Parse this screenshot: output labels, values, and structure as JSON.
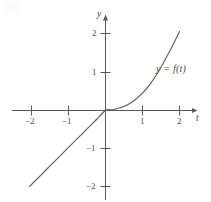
{
  "figure": {
    "name": "graph-of-y-equals-f-of-t",
    "background_color": "#ffffff",
    "ink_color": "#5a5a5a",
    "text_color": "#4a4a4a"
  },
  "axes": {
    "x_axis_name": "t",
    "y_axis_name": "y",
    "x_ticks": [
      {
        "value": -2,
        "label": "−2"
      },
      {
        "value": -1,
        "label": "−1"
      },
      {
        "value": 1,
        "label": "1"
      },
      {
        "value": 2,
        "label": "2"
      }
    ],
    "y_ticks": [
      {
        "value": 2,
        "label": "2"
      },
      {
        "value": 1,
        "label": "1"
      },
      {
        "value": -1,
        "label": "−1"
      },
      {
        "value": -2,
        "label": "−2"
      }
    ]
  },
  "annotations": {
    "curve_label": "y = f(t)"
  },
  "chart_data": {
    "type": "line",
    "title": "",
    "xlabel": "t",
    "ylabel": "y",
    "xlim": [
      -2.5,
      2.45
    ],
    "ylim": [
      -2.45,
      2.45
    ],
    "grid": false,
    "legend": "none",
    "xticks": [
      -2,
      -1,
      1,
      2
    ],
    "yticks": [
      -2,
      -1,
      1,
      2
    ],
    "annotations": [
      {
        "text": "y = f(t)",
        "x": 1.55,
        "y": 1.0
      }
    ],
    "series": [
      {
        "name": "y = f(t)",
        "color": "#5a5a5a",
        "points": [
          {
            "x": -2.05,
            "y": -1.97
          },
          {
            "x": -1.8,
            "y": -1.73
          },
          {
            "x": -1.5,
            "y": -1.44
          },
          {
            "x": -1.2,
            "y": -1.15
          },
          {
            "x": -1.0,
            "y": -0.96
          },
          {
            "x": -0.75,
            "y": -0.72
          },
          {
            "x": -0.5,
            "y": -0.48
          },
          {
            "x": -0.25,
            "y": -0.24
          },
          {
            "x": 0,
            "y": 0
          },
          {
            "x": 0.2,
            "y": 0.02
          },
          {
            "x": 0.4,
            "y": 0.07
          },
          {
            "x": 0.6,
            "y": 0.15
          },
          {
            "x": 0.8,
            "y": 0.28
          },
          {
            "x": 1.0,
            "y": 0.45
          },
          {
            "x": 1.2,
            "y": 0.68
          },
          {
            "x": 1.4,
            "y": 0.96
          },
          {
            "x": 1.6,
            "y": 1.3
          },
          {
            "x": 1.8,
            "y": 1.66
          },
          {
            "x": 2.0,
            "y": 2.05
          }
        ]
      }
    ]
  }
}
